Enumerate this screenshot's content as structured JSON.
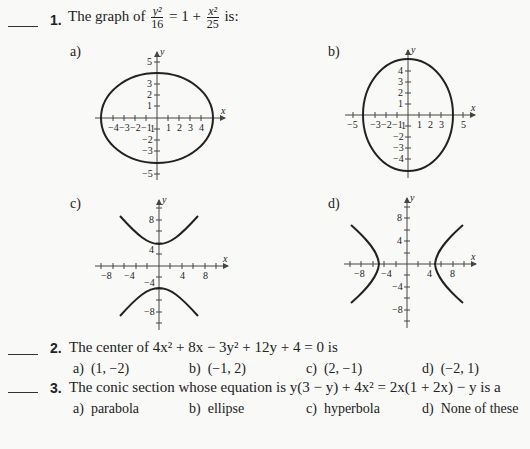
{
  "questions": [
    {
      "number": "1.",
      "text_prefix": "The graph of",
      "frac1_num": "y²",
      "frac1_den": "16",
      "text_mid": "= 1 +",
      "frac2_num": "x²",
      "frac2_den": "25",
      "text_suffix": "is:",
      "options": [
        {
          "label": "a)",
          "graph": "ellipse, horizontal major axis, x-intercepts ±5, y-intercepts ±4",
          "x_ticks": [
            "-4",
            "-3",
            "-2",
            "-1",
            "1",
            "2",
            "3",
            "4"
          ],
          "y_ticks": [
            "5",
            "3",
            "2",
            "1",
            "-1",
            "-2",
            "-3",
            "-5"
          ]
        },
        {
          "label": "b)",
          "graph": "ellipse, vertical major axis, x-intercepts ±4, y-intercepts ±5",
          "x_ticks": [
            "-5",
            "-3",
            "-2",
            "-1",
            "1",
            "2",
            "3",
            "5"
          ],
          "y_ticks": [
            "4",
            "3",
            "2",
            "1",
            "-1",
            "-2",
            "-3",
            "-4"
          ]
        },
        {
          "label": "c)",
          "graph": "hyperbola opening up/down, vertices (0, ±4)",
          "x_ticks": [
            "-8",
            "-4",
            "4",
            "8"
          ],
          "y_ticks": [
            "8",
            "4",
            "-4",
            "-8"
          ]
        },
        {
          "label": "d)",
          "graph": "hyperbola opening left/right, vertices (±5, 0)",
          "x_ticks": [
            "-8",
            "-4",
            "4",
            "8"
          ],
          "y_ticks": [
            "8",
            "4",
            "-4",
            "-8"
          ]
        }
      ],
      "axis_x": "x",
      "axis_y": "y"
    },
    {
      "number": "2.",
      "text": "The center of 4x² + 8x − 3y² + 12y + 4 = 0 is",
      "options": [
        {
          "label": "a)",
          "value": "(1, −2)"
        },
        {
          "label": "b)",
          "value": "(−1, 2)"
        },
        {
          "label": "c)",
          "value": "(2, −1)"
        },
        {
          "label": "d)",
          "value": "(−2, 1)"
        }
      ]
    },
    {
      "number": "3.",
      "text": "The conic section whose equation is y(3 − y) + 4x² = 2x(1 + 2x) − y  is a",
      "options": [
        {
          "label": "a)",
          "value": "parabola"
        },
        {
          "label": "b)",
          "value": "ellipse"
        },
        {
          "label": "c)",
          "value": "hyperbola"
        },
        {
          "label": "d)",
          "value": "None of these"
        }
      ]
    }
  ]
}
